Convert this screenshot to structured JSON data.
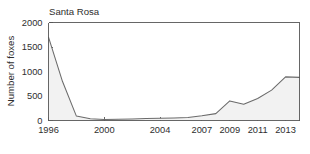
{
  "chart_data": {
    "type": "area",
    "title": "Santa Rosa",
    "xlabel": "",
    "ylabel": "Number of foxes",
    "x": [
      1996,
      1997,
      1998,
      1999,
      2000,
      2001,
      2002,
      2003,
      2004,
      2005,
      2006,
      2007,
      2008,
      2009,
      2010,
      2011,
      2012,
      2013,
      2014
    ],
    "values": [
      1700,
      800,
      90,
      35,
      20,
      25,
      30,
      40,
      45,
      50,
      60,
      95,
      140,
      400,
      330,
      450,
      620,
      890,
      880
    ],
    "series": [
      {
        "name": "Number of foxes",
        "values": [
          1700,
          800,
          90,
          35,
          20,
          25,
          30,
          40,
          45,
          50,
          60,
          95,
          140,
          400,
          330,
          450,
          620,
          890,
          880
        ]
      }
    ],
    "xticks": [
      1996,
      2000,
      2004,
      2007,
      2009,
      2011,
      2013
    ],
    "xticklabels": [
      "1996",
      "2000",
      "2004",
      "2007",
      "2009",
      "2011",
      "2013"
    ],
    "yticks": [
      0,
      500,
      1000,
      1500,
      2000
    ],
    "yticklabels": [
      "0",
      "500",
      "1000",
      "1500",
      "2000"
    ],
    "xlim": [
      1996,
      2014
    ],
    "ylim": [
      0,
      2000
    ],
    "grid": false,
    "legend": false,
    "line_color": "#6b6b6b",
    "fill_color": "#f2f2f2",
    "axis_color": "#555555"
  }
}
